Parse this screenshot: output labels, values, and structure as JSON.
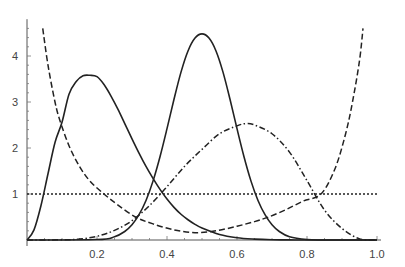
{
  "chart_data": {
    "type": "line",
    "title": "",
    "xlabel": "",
    "ylabel": "",
    "xlim": [
      0,
      1.0
    ],
    "ylim": [
      0,
      4.8
    ],
    "grid": false,
    "legend": null,
    "x_ticks": [
      0.2,
      0.4,
      0.6,
      0.8,
      1.0
    ],
    "x_tick_labels": [
      "0.2",
      "0.4",
      "0.6",
      "0.8",
      "1.0"
    ],
    "y_ticks": [
      1,
      2,
      3,
      4
    ],
    "y_tick_labels": [
      "1",
      "2",
      "3",
      "4"
    ],
    "series": [
      {
        "name": "solid-left",
        "style": "solid",
        "peak": {
          "x": 0.18,
          "y": 3.6
        },
        "x": [
          0.0,
          0.02,
          0.04,
          0.06,
          0.08,
          0.1,
          0.12,
          0.14,
          0.16,
          0.18,
          0.2,
          0.22,
          0.24,
          0.26,
          0.28,
          0.3,
          0.32,
          0.34,
          0.36,
          0.38,
          0.4,
          0.42,
          0.44,
          0.46,
          0.48,
          0.5,
          0.55,
          0.6,
          0.65,
          0.7,
          0.75,
          0.8,
          0.9,
          1.0
        ],
        "values": [
          0.0,
          0.22,
          0.75,
          1.44,
          2.12,
          2.56,
          3.17,
          3.44,
          3.57,
          3.58,
          3.55,
          3.38,
          3.13,
          2.84,
          2.52,
          2.2,
          1.89,
          1.6,
          1.34,
          1.1,
          0.89,
          0.71,
          0.56,
          0.44,
          0.34,
          0.26,
          0.12,
          0.05,
          0.02,
          0.006,
          0.002,
          0.0,
          0.0,
          0.0
        ]
      },
      {
        "name": "solid-center",
        "style": "solid",
        "peak": {
          "x": 0.5,
          "y": 4.48
        },
        "x": [
          0.0,
          0.2,
          0.25,
          0.28,
          0.3,
          0.32,
          0.34,
          0.36,
          0.38,
          0.4,
          0.42,
          0.44,
          0.46,
          0.48,
          0.5,
          0.52,
          0.54,
          0.56,
          0.58,
          0.6,
          0.62,
          0.64,
          0.66,
          0.68,
          0.7,
          0.72,
          0.75,
          0.8,
          0.85,
          1.0
        ],
        "values": [
          0.0,
          0.01,
          0.07,
          0.19,
          0.33,
          0.55,
          0.86,
          1.28,
          1.81,
          2.42,
          3.06,
          3.65,
          4.11,
          4.39,
          4.48,
          4.39,
          4.11,
          3.65,
          3.06,
          2.42,
          1.81,
          1.28,
          0.86,
          0.55,
          0.33,
          0.19,
          0.07,
          0.01,
          0.0,
          0.0
        ]
      },
      {
        "name": "dash-dot",
        "style": "dashdot",
        "peak": {
          "x": 0.625,
          "y": 2.53
        },
        "x": [
          0.0,
          0.1,
          0.15,
          0.2,
          0.25,
          0.3,
          0.35,
          0.4,
          0.45,
          0.5,
          0.55,
          0.6,
          0.625,
          0.65,
          0.7,
          0.75,
          0.8,
          0.85,
          0.9,
          0.95,
          1.0
        ],
        "values": [
          0.0,
          0.004,
          0.02,
          0.08,
          0.21,
          0.42,
          0.75,
          1.16,
          1.6,
          1.97,
          2.31,
          2.48,
          2.53,
          2.5,
          2.31,
          1.91,
          1.29,
          0.65,
          0.25,
          0.025,
          0.0
        ]
      },
      {
        "name": "dashed",
        "style": "dashed",
        "x": [
          0.045,
          0.06,
          0.08,
          0.094,
          0.12,
          0.15,
          0.18,
          0.22,
          0.26,
          0.31,
          0.36,
          0.42,
          0.48,
          0.54,
          0.6,
          0.65,
          0.69,
          0.74,
          0.79,
          0.84,
          0.88,
          0.91,
          0.93,
          0.95,
          0.96
        ],
        "values": [
          4.6,
          3.8,
          3.0,
          2.6,
          2.05,
          1.6,
          1.28,
          1.0,
          0.76,
          0.5,
          0.35,
          0.22,
          0.16,
          0.2,
          0.3,
          0.4,
          0.5,
          0.66,
          0.85,
          1.0,
          1.55,
          2.3,
          3.0,
          3.9,
          4.6
        ]
      },
      {
        "name": "dotted-uniform",
        "style": "dotted",
        "x": [
          0.0,
          1.0
        ],
        "values": [
          1.0,
          1.0
        ]
      }
    ]
  }
}
